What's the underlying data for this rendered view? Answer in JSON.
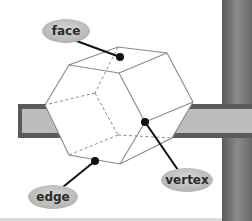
{
  "diagram": {
    "labels": {
      "face": "face",
      "edge": "edge",
      "vertex": "vertex"
    },
    "colors": {
      "background": "#ffffff",
      "band_fill": "#b8b8b8",
      "band_border": "#5a5a5a",
      "panel_dark": "#6e6e6e",
      "label_bubble": "#c8c8c8",
      "edge_line": "#8a8a8a",
      "pointer": "#111111"
    }
  }
}
